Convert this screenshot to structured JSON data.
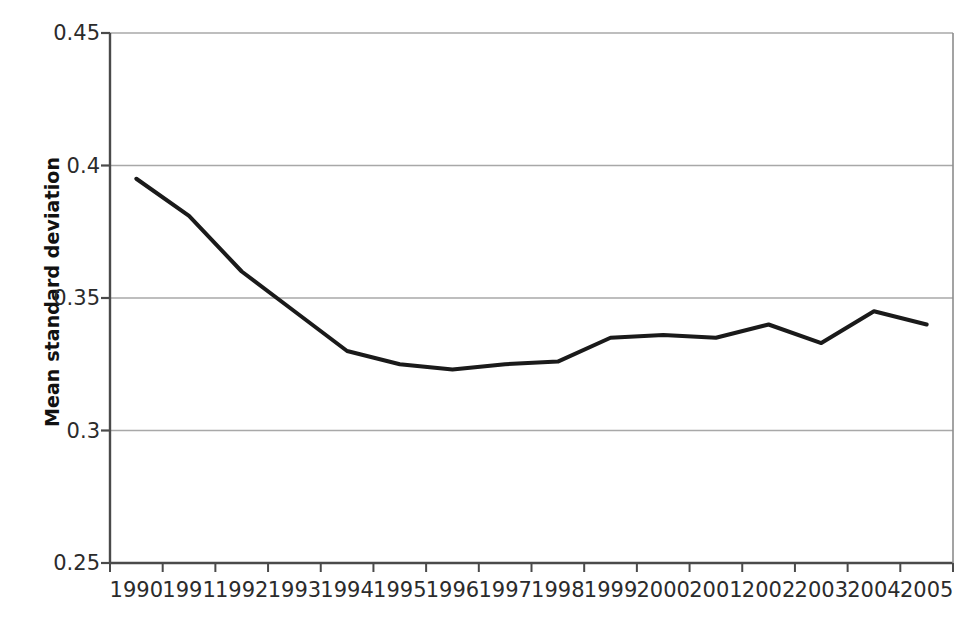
{
  "chart_data": {
    "type": "line",
    "title": "",
    "xlabel": "",
    "ylabel": "Mean standard deviation",
    "categories": [
      "1990",
      "1991",
      "1992",
      "1993",
      "1994",
      "1995",
      "1996",
      "1997",
      "1998",
      "1999",
      "2000",
      "2001",
      "2002",
      "2003",
      "2004",
      "2005"
    ],
    "values": [
      0.395,
      0.381,
      0.36,
      0.345,
      0.33,
      0.325,
      0.323,
      0.325,
      0.326,
      0.335,
      0.336,
      0.335,
      0.34,
      0.333,
      0.345,
      0.34
    ],
    "series": [
      {
        "name": "Mean standard deviation",
        "values": [
          0.395,
          0.381,
          0.36,
          0.345,
          0.33,
          0.325,
          0.323,
          0.325,
          0.326,
          0.335,
          0.336,
          0.335,
          0.34,
          0.333,
          0.345,
          0.34
        ]
      }
    ],
    "ylim": [
      0.25,
      0.45
    ],
    "ytick_labels": [
      "0.45",
      "0.4",
      "0.35",
      "0.3",
      "0.25"
    ],
    "ytick_values": [
      0.45,
      0.4,
      0.35,
      0.3,
      0.25
    ],
    "grid": true,
    "grid_axis": "y",
    "legend": "none",
    "line_color": "#1a1a1a",
    "grid_color": "#a8a8a8",
    "axis_color": "#4a4a4a",
    "background_color": "#ffffff",
    "markers": "none",
    "line_width": 4
  },
  "axis": {
    "y_title": "Mean standard deviation"
  }
}
